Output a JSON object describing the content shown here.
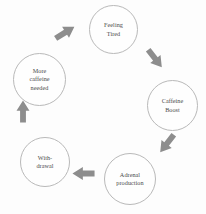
{
  "diagram": {
    "type": "cycle-diagram",
    "node_count": 5,
    "arrow_count": 5,
    "colors": {
      "background": "#fdfdfd",
      "node_stroke": "#b9b9b9",
      "node_fill": "#fefefe",
      "text": "#4a4a4a",
      "arrow_fill": "#8d8d8d"
    },
    "nodes": [
      {
        "id": "feeling-tired",
        "label": "Feeling\nTired",
        "x": 89,
        "y": 5,
        "size": 49
      },
      {
        "id": "caffeine-boost",
        "label": "Caffeine\nBoost",
        "x": 147,
        "y": 80,
        "size": 51
      },
      {
        "id": "adrenal-production",
        "label": "Adrenal\nproduction",
        "x": 104,
        "y": 153,
        "size": 52
      },
      {
        "id": "withdrawal",
        "label": "With-\ndrawal",
        "x": 20,
        "y": 137,
        "size": 50
      },
      {
        "id": "more-caffeine-needed",
        "label": "More\ncaffeine\nneeded",
        "x": 13,
        "y": 53,
        "size": 53
      }
    ],
    "arrows": [
      {
        "id": "arrow-withdrawal-to-more-caffeine",
        "from": "withdrawal",
        "to": "more-caffeine-needed",
        "direction": "up",
        "rotation": -90,
        "x": 12,
        "y": 105,
        "length": 22,
        "thickness": 13
      },
      {
        "id": "arrow-more-caffeine-to-feeling-tired",
        "from": "more-caffeine-needed",
        "to": "feeling-tired",
        "direction": "up-right",
        "rotation": -32,
        "x": 53,
        "y": 26,
        "length": 24,
        "thickness": 13
      },
      {
        "id": "arrow-feeling-tired-to-caffeine-boost",
        "from": "feeling-tired",
        "to": "caffeine-boost",
        "direction": "down-right",
        "rotation": 52,
        "x": 143,
        "y": 52,
        "length": 24,
        "thickness": 13
      },
      {
        "id": "arrow-caffeine-boost-to-adrenal",
        "from": "caffeine-boost",
        "to": "adrenal-production",
        "direction": "down-left",
        "rotation": 128,
        "x": 155,
        "y": 137,
        "length": 24,
        "thickness": 13
      },
      {
        "id": "arrow-adrenal-to-withdrawal",
        "from": "adrenal-production",
        "to": "withdrawal",
        "direction": "left",
        "rotation": 180,
        "x": 72,
        "y": 167,
        "length": 23,
        "thickness": 13
      }
    ]
  }
}
